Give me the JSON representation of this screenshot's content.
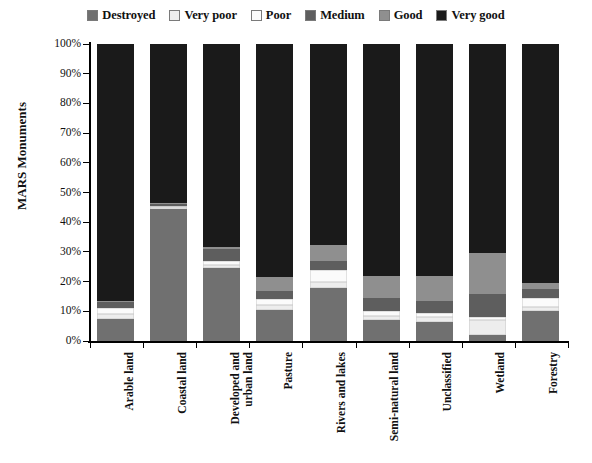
{
  "chart_data": {
    "type": "bar",
    "subtype": "stacked-percentage-column",
    "title": "",
    "xlabel": "",
    "ylabel": "MARS Monuments",
    "ylim": [
      0,
      100
    ],
    "ytick_labels": [
      "0%",
      "10%",
      "20%",
      "30%",
      "40%",
      "50%",
      "60%",
      "70%",
      "80%",
      "90%",
      "100%"
    ],
    "ytick_values": [
      0,
      10,
      20,
      30,
      40,
      50,
      60,
      70,
      80,
      90,
      100
    ],
    "grid": false,
    "legend_position": "top",
    "categories": [
      "Arable land",
      "Coastal land",
      "Developed and\nurban land",
      "Pasture",
      "Rivers and lakes",
      "Semi-natural land",
      "Unclassified",
      "Wetland",
      "Forestry"
    ],
    "series": [
      {
        "name": "Destroyed",
        "color": "#707070",
        "values": [
          7.5,
          44.5,
          24.5,
          10.5,
          18.0,
          7.0,
          6.5,
          2.0,
          10.0
        ]
      },
      {
        "name": "Very poor",
        "color": "#ededed",
        "values": [
          1.5,
          0.5,
          1.0,
          1.5,
          2.0,
          1.5,
          1.5,
          5.0,
          1.5
        ]
      },
      {
        "name": "Poor",
        "color": "#fbfbfb",
        "values": [
          2.0,
          0.5,
          1.5,
          2.0,
          4.0,
          1.5,
          1.5,
          1.0,
          3.0
        ]
      },
      {
        "name": "Medium",
        "color": "#5e5e5e",
        "values": [
          2.0,
          0.5,
          4.0,
          3.0,
          3.0,
          4.5,
          4.0,
          8.0,
          3.0
        ]
      },
      {
        "name": "Good",
        "color": "#8f8f8f",
        "values": [
          0.5,
          0.5,
          0.5,
          4.5,
          5.5,
          7.5,
          8.5,
          13.5,
          2.0
        ]
      },
      {
        "name": "Very good",
        "color": "#1a1a1a",
        "values": [
          86.5,
          53.5,
          68.5,
          78.5,
          67.5,
          78.0,
          78.0,
          70.5,
          80.5
        ]
      }
    ]
  },
  "legend": {
    "items": [
      {
        "label": "Destroyed",
        "swatch": "#707070"
      },
      {
        "label": "Very poor",
        "swatch": "#ededed"
      },
      {
        "label": "Poor",
        "swatch": "#fbfbfb"
      },
      {
        "label": "Medium",
        "swatch": "#5e5e5e"
      },
      {
        "label": "Good",
        "swatch": "#8f8f8f"
      },
      {
        "label": "Very good",
        "swatch": "#1a1a1a"
      }
    ]
  }
}
